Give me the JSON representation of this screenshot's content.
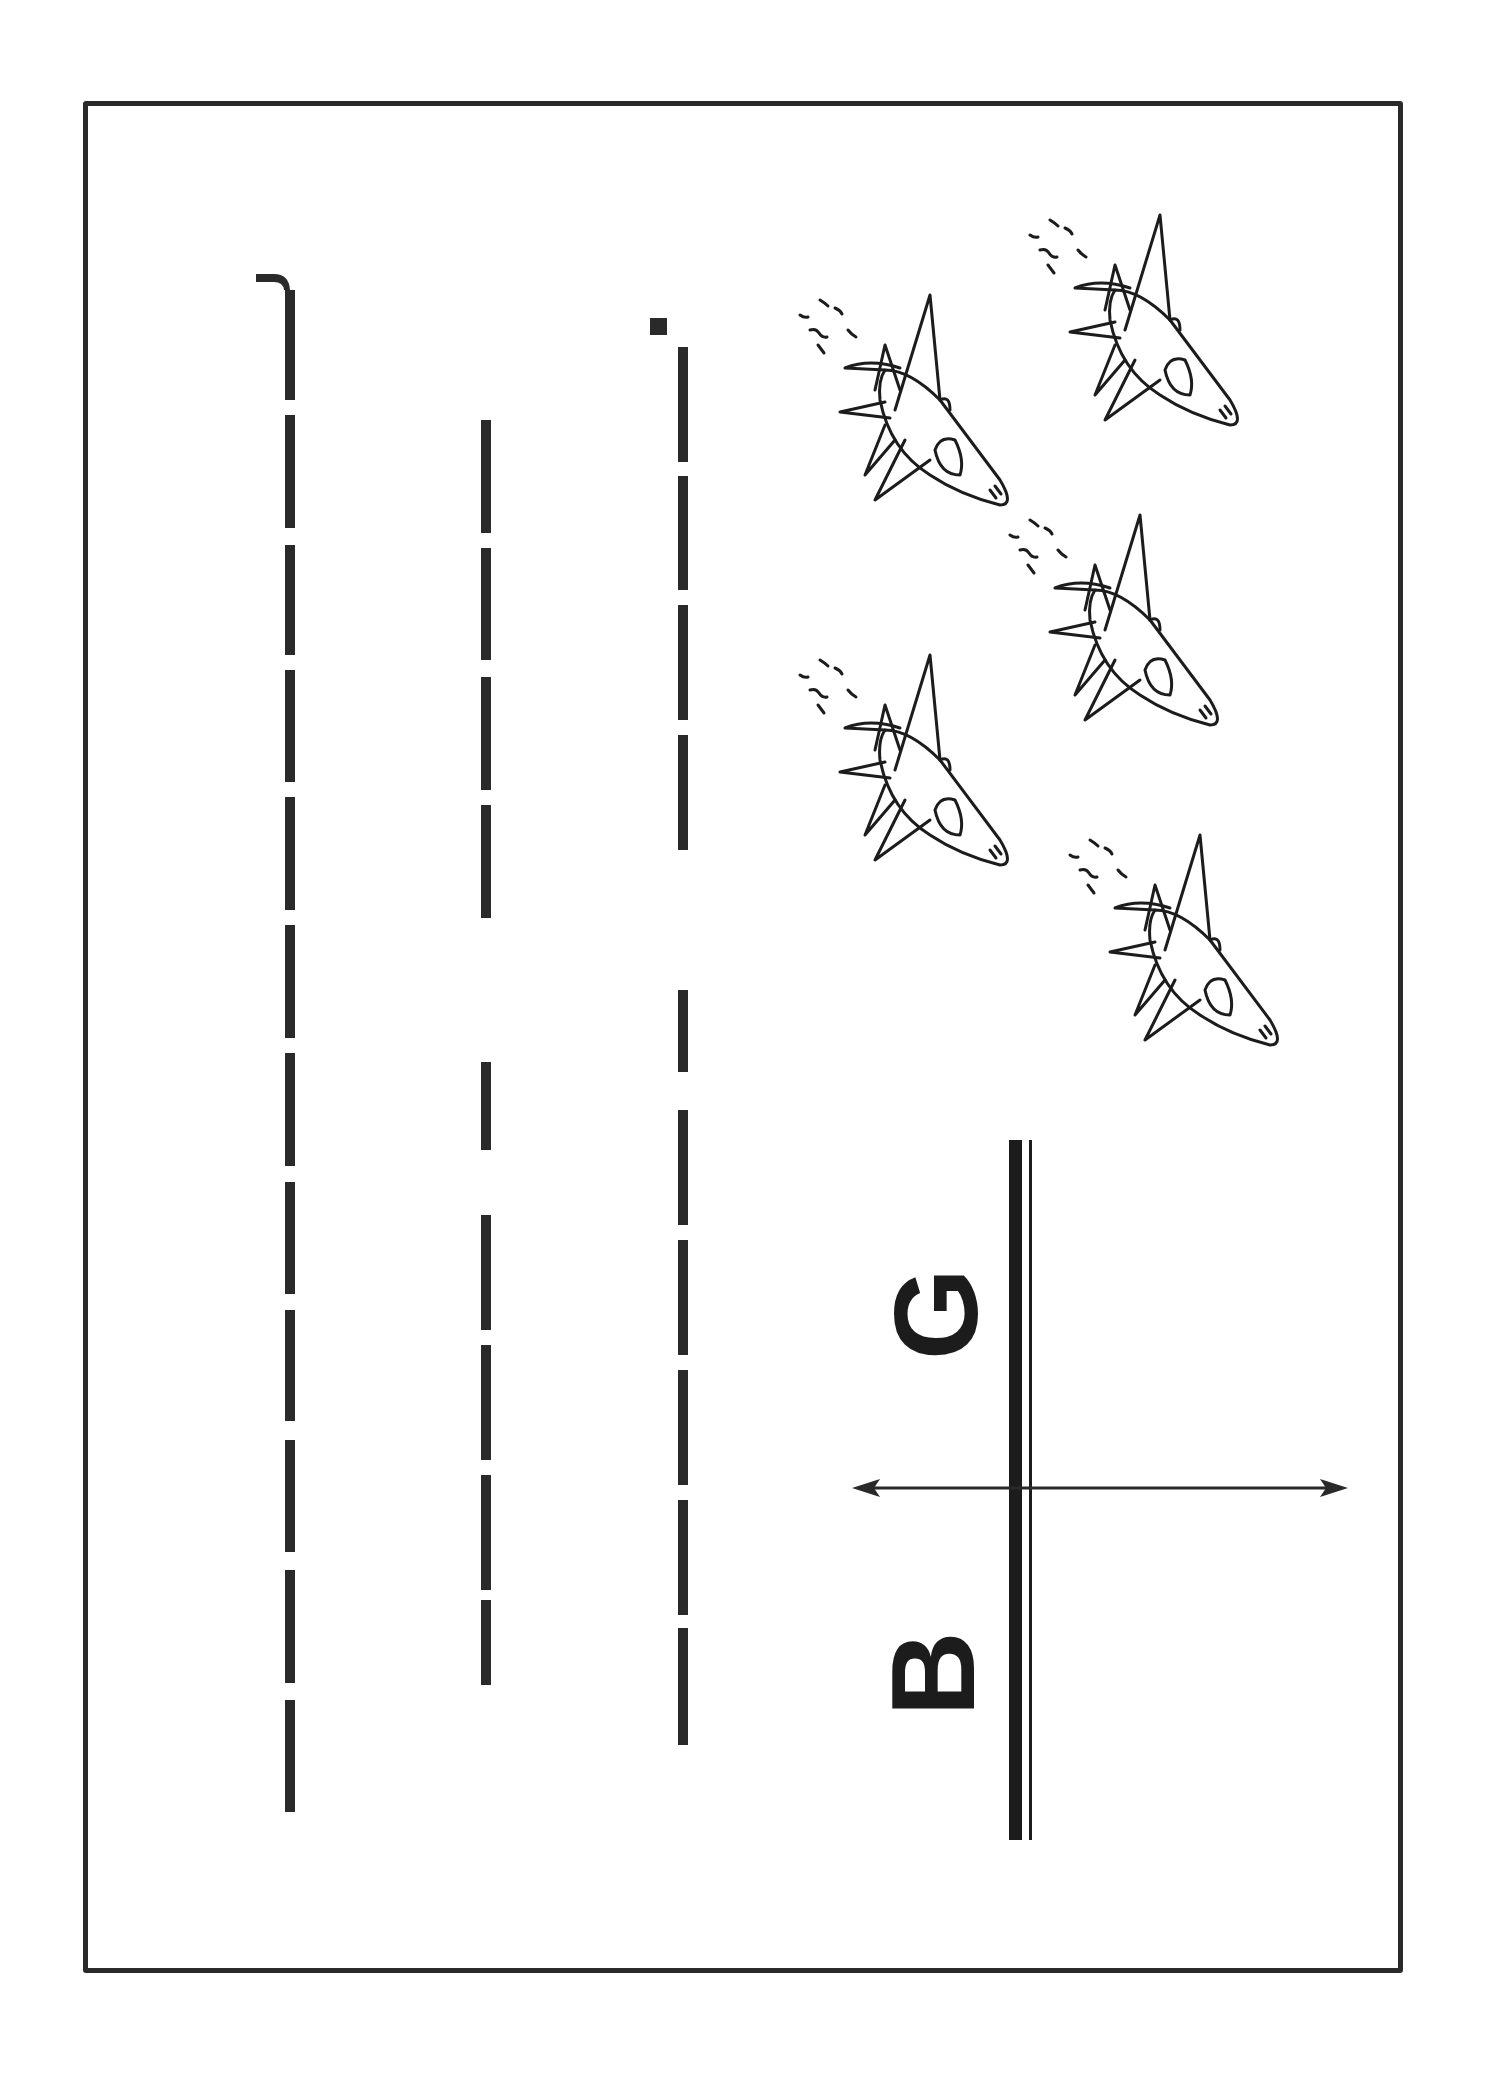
{
  "worksheet": {
    "type": "letter tracing practice (rotated page)",
    "letters": [
      {
        "char": "B",
        "x": 950,
        "y": 1640
      },
      {
        "char": "G",
        "x": 950,
        "y": 1270
      }
    ],
    "colors": {
      "ink": "#2a2a2a",
      "paper": "#ffffff"
    },
    "tracing_columns": [
      {
        "x": 290,
        "dashes": [
          [
            290,
            400
          ],
          [
            415,
            528
          ],
          [
            545,
            655
          ],
          [
            670,
            782
          ],
          [
            797,
            910
          ],
          [
            925,
            1038
          ],
          [
            1053,
            1166
          ],
          [
            1182,
            1294
          ],
          [
            1310,
            1421
          ],
          [
            1440,
            1552
          ],
          [
            1570,
            1683
          ],
          [
            1700,
            1812
          ]
        ]
      },
      {
        "x": 486,
        "dashes": [
          [
            420,
            533
          ],
          [
            548,
            660
          ],
          [
            677,
            790
          ],
          [
            805,
            918
          ],
          [
            1062,
            1150
          ],
          [
            1215,
            1330
          ],
          [
            1345,
            1460
          ],
          [
            1475,
            1590
          ],
          [
            1600,
            1685
          ]
        ]
      },
      {
        "x": 683,
        "dashes": [
          [
            347,
            462
          ],
          [
            476,
            590
          ],
          [
            605,
            720
          ],
          [
            735,
            850
          ],
          [
            990,
            1072
          ],
          [
            1110,
            1225
          ],
          [
            1240,
            1355
          ],
          [
            1370,
            1485
          ],
          [
            1500,
            1615
          ],
          [
            1628,
            1745
          ]
        ]
      }
    ],
    "jets": [
      {
        "x": 790,
        "y": 290,
        "scale": 1.0
      },
      {
        "x": 1020,
        "y": 210,
        "scale": 1.0
      },
      {
        "x": 1000,
        "y": 510,
        "scale": 1.0
      },
      {
        "x": 790,
        "y": 650,
        "scale": 1.0
      },
      {
        "x": 1060,
        "y": 830,
        "scale": 1.0
      }
    ],
    "guide": {
      "thick_line": {
        "x": 1015,
        "y1": 1140,
        "y2": 1840
      },
      "thin_line": {
        "x": 1030,
        "y1": 1140,
        "y2": 1840
      },
      "arrow": {
        "y": 1488,
        "x1": 855,
        "x2": 1345
      }
    }
  }
}
